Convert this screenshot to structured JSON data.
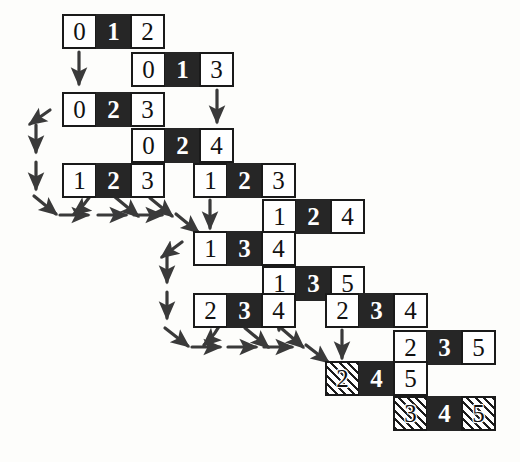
{
  "diagram": {
    "cell_width": 35,
    "cell_height": 35,
    "fill_legend": {
      "white": "#ffffff",
      "black": "#262626",
      "hatch": "diagonal-stripes",
      "border": "#1a1a1a",
      "arrow": "#3a3a3a"
    },
    "rows": [
      {
        "row_index": 0,
        "x": 62,
        "y": 14,
        "cells": [
          {
            "value": "0",
            "fill": "white"
          },
          {
            "value": "1",
            "fill": "black"
          },
          {
            "value": "2",
            "fill": "white"
          }
        ]
      },
      {
        "row_index": 1,
        "x": 131,
        "y": 52,
        "cells": [
          {
            "value": "0",
            "fill": "white"
          },
          {
            "value": "1",
            "fill": "black"
          },
          {
            "value": "3",
            "fill": "white"
          }
        ]
      },
      {
        "row_index": 2,
        "x": 62,
        "y": 92,
        "cells": [
          {
            "value": "0",
            "fill": "white"
          },
          {
            "value": "2",
            "fill": "black"
          },
          {
            "value": "3",
            "fill": "white"
          }
        ]
      },
      {
        "row_index": 3,
        "x": 131,
        "y": 128,
        "cells": [
          {
            "value": "0",
            "fill": "white"
          },
          {
            "value": "2",
            "fill": "black"
          },
          {
            "value": "4",
            "fill": "white"
          }
        ]
      },
      {
        "row_index": 4,
        "x": 62,
        "y": 163,
        "cells": [
          {
            "value": "1",
            "fill": "white"
          },
          {
            "value": "2",
            "fill": "black"
          },
          {
            "value": "3",
            "fill": "white"
          }
        ]
      },
      {
        "row_index": 5,
        "x": 193,
        "y": 163,
        "cells": [
          {
            "value": "1",
            "fill": "white"
          },
          {
            "value": "2",
            "fill": "black"
          },
          {
            "value": "3",
            "fill": "white"
          }
        ]
      },
      {
        "row_index": 6,
        "x": 262,
        "y": 199,
        "cells": [
          {
            "value": "1",
            "fill": "white"
          },
          {
            "value": "2",
            "fill": "black"
          },
          {
            "value": "4",
            "fill": "white"
          }
        ]
      },
      {
        "row_index": 7,
        "x": 193,
        "y": 231,
        "cells": [
          {
            "value": "1",
            "fill": "white"
          },
          {
            "value": "3",
            "fill": "black"
          },
          {
            "value": "4",
            "fill": "white"
          }
        ]
      },
      {
        "row_index": 8,
        "x": 262,
        "y": 266,
        "cells": [
          {
            "value": "1",
            "fill": "white"
          },
          {
            "value": "3",
            "fill": "black"
          },
          {
            "value": "5",
            "fill": "white"
          }
        ]
      },
      {
        "row_index": 9,
        "x": 193,
        "y": 293,
        "cells": [
          {
            "value": "2",
            "fill": "white"
          },
          {
            "value": "3",
            "fill": "black"
          },
          {
            "value": "4",
            "fill": "white"
          }
        ]
      },
      {
        "row_index": 10,
        "x": 325,
        "y": 293,
        "cells": [
          {
            "value": "2",
            "fill": "white"
          },
          {
            "value": "3",
            "fill": "black"
          },
          {
            "value": "4",
            "fill": "white"
          }
        ]
      },
      {
        "row_index": 11,
        "x": 393,
        "y": 330,
        "cells": [
          {
            "value": "2",
            "fill": "white"
          },
          {
            "value": "3",
            "fill": "black"
          },
          {
            "value": "5",
            "fill": "white"
          }
        ]
      },
      {
        "row_index": 12,
        "x": 325,
        "y": 361,
        "cells": [
          {
            "value": "2",
            "fill": "hatch"
          },
          {
            "value": "4",
            "fill": "black"
          },
          {
            "value": "5",
            "fill": "white"
          }
        ]
      },
      {
        "row_index": 13,
        "x": 393,
        "y": 396,
        "cells": [
          {
            "value": "3",
            "fill": "hatch"
          },
          {
            "value": "4",
            "fill": "black"
          },
          {
            "value": "5",
            "fill": "hatch"
          }
        ]
      }
    ],
    "arrows": {
      "down": [
        {
          "name": "down-arrow-row0",
          "x": 79,
          "y1": 52,
          "y2": 84
        },
        {
          "name": "down-arrow-row1",
          "x": 217,
          "y1": 90,
          "y2": 122
        },
        {
          "name": "down-arrow-row4",
          "x": 210,
          "y1": 200,
          "y2": 228
        },
        {
          "name": "down-arrow-row6",
          "x": 279,
          "y1": 236,
          "y2": 264
        },
        {
          "name": "down-arrow-row8",
          "x": 279,
          "y1": 303,
          "y2": 330
        },
        {
          "name": "down-arrow-row10",
          "x": 342,
          "y1": 330,
          "y2": 358
        },
        {
          "name": "down-arrow-row11",
          "x": 411,
          "y1": 366,
          "y2": 394
        },
        {
          "name": "down-chain-left-1",
          "x": 36,
          "y1": 125,
          "y2": 152
        },
        {
          "name": "down-chain-left-2",
          "x": 36,
          "y1": 162,
          "y2": 189
        },
        {
          "name": "down-chain-mid-1",
          "x": 167,
          "y1": 256,
          "y2": 282
        },
        {
          "name": "down-chain-mid-2",
          "x": 167,
          "y1": 292,
          "y2": 318
        }
      ],
      "diagonal": [
        {
          "name": "diag-arrow-left-in",
          "x1": 50,
          "y1": 110,
          "x2": 30,
          "y2": 124
        },
        {
          "name": "diag-arrow-left-out",
          "x1": 34,
          "y1": 196,
          "x2": 56,
          "y2": 214
        },
        {
          "name": "diag-arrow-left-branch",
          "x1": 115,
          "y1": 197,
          "x2": 138,
          "y2": 216
        },
        {
          "name": "diag-arrow-left-end",
          "x1": 150,
          "y1": 198,
          "x2": 172,
          "y2": 216
        },
        {
          "name": "diag-arrow-left-tail",
          "x1": 176,
          "y1": 214,
          "x2": 198,
          "y2": 232
        },
        {
          "name": "diag-arrow-mid-in",
          "x1": 182,
          "y1": 242,
          "x2": 162,
          "y2": 257
        },
        {
          "name": "diag-arrow-mid-out",
          "x1": 165,
          "y1": 328,
          "x2": 188,
          "y2": 346
        },
        {
          "name": "diag-arrow-mid-branch",
          "x1": 245,
          "y1": 328,
          "x2": 268,
          "y2": 347
        },
        {
          "name": "diag-arrow-mid-end",
          "x1": 281,
          "y1": 328,
          "x2": 303,
          "y2": 347
        },
        {
          "name": "diag-arrow-mid-tail",
          "x1": 306,
          "y1": 345,
          "x2": 328,
          "y2": 362
        }
      ],
      "horizontal": [
        {
          "name": "right-arrow-left-1",
          "x1": 60,
          "y": 215,
          "x2": 88
        },
        {
          "name": "right-arrow-left-2",
          "x1": 98,
          "y": 215,
          "x2": 126
        },
        {
          "name": "right-arrow-left-3",
          "x1": 134,
          "y": 215,
          "x2": 162
        },
        {
          "name": "right-arrow-mid-1",
          "x1": 192,
          "y": 347,
          "x2": 220
        },
        {
          "name": "right-arrow-mid-2",
          "x1": 228,
          "y": 347,
          "x2": 256
        },
        {
          "name": "right-arrow-mid-3",
          "x1": 264,
          "y": 347,
          "x2": 292
        }
      ],
      "curves": [
        {
          "name": "curve-left-merge",
          "path": "M 94 190 C 88 200, 82 208, 74 214"
        },
        {
          "name": "curve-mid-merge",
          "path": "M 222 320 C 218 330, 212 338, 204 345"
        }
      ]
    }
  }
}
